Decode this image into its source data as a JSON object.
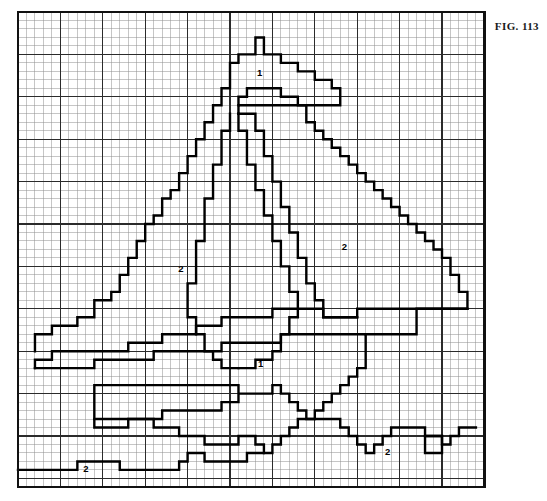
{
  "figure": {
    "label": "FIG. 113",
    "kind": "pixel-grid-pattern-chart"
  },
  "colors": {
    "background": "#ffffff",
    "minor_grid": "#8e8e8e",
    "major_grid": "#2b2b2b",
    "border": "#111111",
    "pattern_stroke": "#000000",
    "label_text": "#000000"
  },
  "grid": {
    "cols": 55,
    "rows": 56,
    "cell_px": 8.48,
    "origin_x": 18,
    "origin_y": 12,
    "major_every": 5,
    "minor_line_width": 0.5,
    "major_line_width": 1.1,
    "border_line_width": 2.2,
    "show_grid": true
  },
  "chart_data": {
    "type": "table",
    "title": "FIG. 113",
    "xlabel": "",
    "ylabel": "",
    "legend": [
      "1",
      "2"
    ],
    "region_labels": [
      {
        "symbol": "1",
        "col": 28.5,
        "row": 7.2,
        "region": "upper-sail-tip"
      },
      {
        "symbol": "2",
        "col": 19.2,
        "row": 30.4,
        "region": "left-mainsail"
      },
      {
        "symbol": "2",
        "col": 38.5,
        "row": 27.8,
        "region": "right-sail"
      },
      {
        "symbol": "1",
        "col": 28.6,
        "row": 41.6,
        "region": "hull-upper"
      },
      {
        "symbol": "2",
        "col": 43.6,
        "row": 51.9,
        "region": "hull-right-waterline"
      },
      {
        "symbol": "2",
        "col": 8.0,
        "row": 53.9,
        "region": "hull-left-waterline"
      }
    ],
    "outlines": [
      {
        "name": "mainsail-left-outline",
        "closed": false,
        "points": [
          [
            2,
            40
          ],
          [
            2,
            38
          ],
          [
            4,
            38
          ],
          [
            4,
            37
          ],
          [
            7,
            37
          ],
          [
            7,
            36
          ],
          [
            9,
            36
          ],
          [
            9,
            34
          ],
          [
            11,
            34
          ],
          [
            11,
            33
          ],
          [
            12,
            33
          ],
          [
            12,
            31
          ],
          [
            13,
            31
          ],
          [
            13,
            29
          ],
          [
            14,
            29
          ],
          [
            14,
            27
          ],
          [
            15,
            27
          ],
          [
            15,
            25
          ],
          [
            16,
            25
          ],
          [
            16,
            24
          ],
          [
            17,
            24
          ],
          [
            17,
            22
          ],
          [
            18,
            22
          ],
          [
            18,
            21
          ],
          [
            19,
            21
          ],
          [
            19,
            19
          ],
          [
            20,
            19
          ],
          [
            20,
            17
          ],
          [
            21,
            17
          ],
          [
            21,
            15
          ],
          [
            22,
            15
          ],
          [
            22,
            13
          ],
          [
            23,
            13
          ],
          [
            23,
            11
          ],
          [
            24,
            11
          ],
          [
            24,
            9
          ],
          [
            25,
            9
          ],
          [
            25,
            6
          ],
          [
            26,
            6
          ],
          [
            26,
            5
          ],
          [
            28,
            5
          ],
          [
            28,
            3
          ],
          [
            29,
            3
          ],
          [
            29,
            5
          ],
          [
            31,
            5
          ],
          [
            31,
            6
          ],
          [
            33,
            6
          ],
          [
            33,
            7
          ],
          [
            35,
            7
          ],
          [
            35,
            8
          ],
          [
            37,
            8
          ],
          [
            37,
            9
          ],
          [
            38,
            9
          ],
          [
            38,
            10
          ],
          [
            38,
            11
          ],
          [
            26,
            11
          ],
          [
            26,
            12
          ]
        ]
      },
      {
        "name": "mainsail-inner-right-edge",
        "closed": false,
        "points": [
          [
            26,
            12
          ],
          [
            26,
            14
          ],
          [
            27,
            14
          ],
          [
            27,
            18
          ],
          [
            28,
            18
          ],
          [
            28,
            21
          ],
          [
            29,
            21
          ],
          [
            29,
            24
          ],
          [
            30,
            24
          ],
          [
            30,
            27
          ],
          [
            31,
            27
          ],
          [
            31,
            30
          ],
          [
            32,
            30
          ],
          [
            32,
            33
          ],
          [
            33,
            33
          ],
          [
            33,
            36
          ],
          [
            32,
            36
          ],
          [
            32,
            38
          ],
          [
            31,
            38
          ],
          [
            31,
            40
          ],
          [
            30,
            40
          ],
          [
            30,
            41
          ],
          [
            28,
            41
          ],
          [
            28,
            42
          ],
          [
            26,
            42
          ]
        ]
      },
      {
        "name": "jib-sail-outline",
        "closed": false,
        "points": [
          [
            25,
            12
          ],
          [
            25,
            14
          ],
          [
            24,
            14
          ],
          [
            24,
            18
          ],
          [
            23,
            18
          ],
          [
            23,
            22
          ],
          [
            22,
            22
          ],
          [
            22,
            27
          ],
          [
            21,
            27
          ],
          [
            21,
            32
          ],
          [
            20,
            32
          ],
          [
            20,
            36
          ],
          [
            21,
            36
          ],
          [
            21,
            38
          ],
          [
            22,
            38
          ],
          [
            22,
            40
          ],
          [
            23,
            40
          ],
          [
            23,
            41
          ],
          [
            24,
            41
          ],
          [
            24,
            42
          ],
          [
            26,
            42
          ]
        ]
      },
      {
        "name": "foresail-right-outline",
        "closed": false,
        "points": [
          [
            26,
            11
          ],
          [
            26,
            10
          ],
          [
            27,
            10
          ],
          [
            27,
            9
          ],
          [
            31,
            9
          ],
          [
            31,
            10
          ],
          [
            33,
            10
          ],
          [
            33,
            11
          ],
          [
            34,
            11
          ],
          [
            34,
            13
          ],
          [
            35,
            13
          ],
          [
            35,
            14
          ],
          [
            36,
            14
          ],
          [
            36,
            15
          ],
          [
            37,
            15
          ],
          [
            37,
            16
          ],
          [
            38,
            16
          ],
          [
            38,
            17
          ],
          [
            39,
            17
          ],
          [
            39,
            18
          ],
          [
            40,
            18
          ],
          [
            40,
            19
          ],
          [
            41,
            19
          ],
          [
            41,
            20
          ],
          [
            42,
            20
          ],
          [
            42,
            21
          ],
          [
            43,
            21
          ],
          [
            43,
            22
          ],
          [
            44,
            22
          ],
          [
            44,
            23
          ],
          [
            45,
            23
          ],
          [
            45,
            24
          ],
          [
            46,
            24
          ],
          [
            46,
            25
          ],
          [
            47,
            25
          ],
          [
            47,
            26
          ],
          [
            48,
            26
          ],
          [
            48,
            27
          ],
          [
            49,
            27
          ],
          [
            49,
            28
          ],
          [
            50,
            28
          ],
          [
            50,
            29
          ],
          [
            51,
            29
          ],
          [
            51,
            31
          ],
          [
            52,
            31
          ],
          [
            52,
            33
          ],
          [
            53,
            33
          ],
          [
            53,
            34
          ],
          [
            53,
            35
          ],
          [
            40,
            35
          ],
          [
            40,
            36
          ],
          [
            36,
            36
          ],
          [
            36,
            34
          ],
          [
            35,
            34
          ],
          [
            35,
            32
          ],
          [
            34,
            32
          ],
          [
            34,
            29
          ],
          [
            33,
            29
          ],
          [
            33,
            26
          ],
          [
            32,
            26
          ],
          [
            32,
            23
          ],
          [
            31,
            23
          ],
          [
            31,
            20
          ],
          [
            30,
            20
          ],
          [
            30,
            17
          ],
          [
            29,
            17
          ],
          [
            29,
            14
          ],
          [
            28,
            14
          ],
          [
            28,
            12
          ],
          [
            26,
            12
          ]
        ]
      },
      {
        "name": "boom-upper-deck-line",
        "closed": false,
        "points": [
          [
            2,
            42
          ],
          [
            2,
            41
          ],
          [
            4,
            41
          ],
          [
            4,
            40
          ],
          [
            13,
            40
          ],
          [
            13,
            39
          ],
          [
            17,
            39
          ],
          [
            17,
            38
          ],
          [
            21,
            38
          ],
          [
            21,
            37
          ],
          [
            24,
            37
          ],
          [
            24,
            36
          ],
          [
            30,
            36
          ],
          [
            30,
            35
          ],
          [
            36,
            35
          ],
          [
            36,
            36
          ],
          [
            40,
            36
          ]
        ]
      },
      {
        "name": "hull-upper-outline",
        "closed": false,
        "points": [
          [
            2,
            42
          ],
          [
            9,
            42
          ],
          [
            9,
            41
          ],
          [
            16,
            41
          ],
          [
            16,
            40
          ],
          [
            24,
            40
          ],
          [
            24,
            39
          ],
          [
            31,
            39
          ],
          [
            31,
            38
          ],
          [
            41,
            38
          ],
          [
            41,
            42
          ],
          [
            40,
            42
          ],
          [
            40,
            43
          ],
          [
            39,
            43
          ],
          [
            39,
            44
          ],
          [
            38,
            44
          ],
          [
            38,
            45
          ],
          [
            37,
            45
          ],
          [
            37,
            46
          ],
          [
            36,
            46
          ],
          [
            36,
            47
          ],
          [
            35,
            47
          ],
          [
            35,
            48
          ],
          [
            34,
            48
          ],
          [
            34,
            47
          ],
          [
            33,
            47
          ],
          [
            33,
            46
          ],
          [
            32,
            46
          ],
          [
            32,
            45
          ],
          [
            31,
            45
          ],
          [
            31,
            44
          ],
          [
            30,
            44
          ],
          [
            30,
            45
          ],
          [
            26,
            45
          ],
          [
            26,
            44
          ],
          [
            9,
            44
          ],
          [
            9,
            49
          ],
          [
            13,
            49
          ],
          [
            13,
            48
          ],
          [
            17,
            48
          ],
          [
            17,
            47
          ],
          [
            24,
            47
          ],
          [
            24,
            46
          ],
          [
            26,
            46
          ],
          [
            26,
            45
          ]
        ]
      },
      {
        "name": "hull-lower-waterline",
        "closed": false,
        "points": [
          [
            9,
            48
          ],
          [
            16,
            48
          ],
          [
            16,
            49
          ],
          [
            19,
            49
          ],
          [
            19,
            50
          ],
          [
            22,
            50
          ],
          [
            22,
            51
          ],
          [
            26,
            51
          ],
          [
            26,
            50
          ],
          [
            28,
            50
          ],
          [
            28,
            51
          ],
          [
            29,
            51
          ],
          [
            29,
            52
          ],
          [
            30,
            52
          ],
          [
            30,
            51
          ],
          [
            31,
            51
          ],
          [
            31,
            50
          ],
          [
            32,
            50
          ],
          [
            32,
            49
          ],
          [
            33,
            49
          ],
          [
            33,
            48
          ],
          [
            38,
            48
          ],
          [
            38,
            49
          ],
          [
            39,
            49
          ],
          [
            39,
            50
          ],
          [
            40,
            50
          ],
          [
            40,
            51
          ],
          [
            41,
            51
          ],
          [
            41,
            52
          ],
          [
            42,
            52
          ],
          [
            42,
            51
          ],
          [
            43,
            51
          ],
          [
            43,
            50
          ],
          [
            44,
            50
          ],
          [
            44,
            49
          ],
          [
            48,
            49
          ],
          [
            48,
            50
          ],
          [
            50,
            50
          ],
          [
            50,
            51
          ],
          [
            51,
            51
          ],
          [
            51,
            50
          ],
          [
            52,
            50
          ],
          [
            52,
            49
          ],
          [
            54,
            49
          ]
        ]
      },
      {
        "name": "waterline-bottom-strip",
        "closed": false,
        "points": [
          [
            0,
            54
          ],
          [
            7,
            54
          ],
          [
            7,
            53
          ],
          [
            12,
            53
          ],
          [
            12,
            54
          ],
          [
            19,
            54
          ],
          [
            19,
            53
          ],
          [
            20,
            53
          ],
          [
            20,
            52
          ],
          [
            22,
            52
          ],
          [
            22,
            53
          ],
          [
            27,
            53
          ],
          [
            27,
            52
          ],
          [
            29,
            52
          ]
        ]
      },
      {
        "name": "hull-notch-right",
        "closed": true,
        "points": [
          [
            48,
            50
          ],
          [
            48,
            52
          ],
          [
            50,
            52
          ],
          [
            50,
            50
          ],
          [
            48,
            50
          ]
        ]
      },
      {
        "name": "deck-ledge-right",
        "closed": false,
        "points": [
          [
            41,
            38
          ],
          [
            47,
            38
          ],
          [
            47,
            35
          ],
          [
            53,
            35
          ]
        ]
      }
    ]
  }
}
